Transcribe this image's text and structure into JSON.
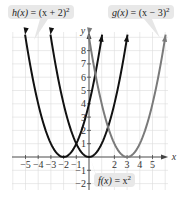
{
  "chart_data": {
    "type": "line",
    "title": "",
    "xlabel": "x",
    "ylabel": "y",
    "xlim": [
      -5.9,
      6.2
    ],
    "ylim": [
      -2.6,
      9.4
    ],
    "grid": true,
    "x_ticks": [
      "-5",
      "-4",
      "-3",
      "-2",
      "-1",
      "2",
      "3",
      "4",
      "5"
    ],
    "y_ticks": [
      "-2",
      "-1",
      "1",
      "2",
      "3",
      "4",
      "5",
      "6",
      "7",
      "8"
    ],
    "series": [
      {
        "name": "h(x) = (x + 2)^2",
        "color": "#111111",
        "vertex": [
          -2,
          0
        ],
        "x": [
          -5,
          -4,
          -3,
          -2,
          -1,
          0,
          1
        ],
        "values": [
          9,
          4,
          1,
          0,
          1,
          4,
          9
        ]
      },
      {
        "name": "f(x) = x^2",
        "color": "#111111",
        "vertex": [
          0,
          0
        ],
        "x": [
          -3,
          -2,
          -1,
          0,
          1,
          2,
          3
        ],
        "values": [
          9,
          4,
          1,
          0,
          1,
          4,
          9
        ]
      },
      {
        "name": "g(x) = (x - 3)^2",
        "color": "#7a7a7a",
        "vertex": [
          3,
          0
        ],
        "x": [
          0,
          1,
          2,
          3,
          4,
          5,
          6
        ],
        "values": [
          9,
          4,
          1,
          0,
          1,
          4,
          9
        ]
      }
    ],
    "annotations": [
      "h(x) = (x + 2)^2",
      "g(x) = (x - 3)^2",
      "f(x) = x^2"
    ]
  },
  "labels": {
    "h": {
      "fn": "h(x)",
      "eq": " = (x + 2)",
      "exp": "2"
    },
    "g": {
      "fn": "g(x)",
      "eq": " = (x − 3)",
      "exp": "2"
    },
    "f": {
      "fn": "f(x)",
      "eq": " = x",
      "exp": "2"
    }
  },
  "axes": {
    "x_label": "x",
    "y_label": "y"
  }
}
